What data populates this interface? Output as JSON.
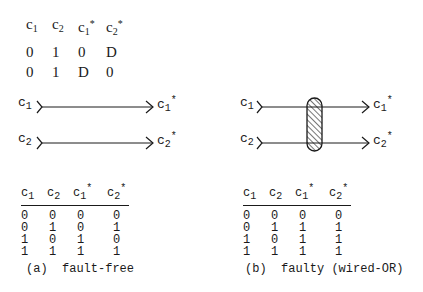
{
  "top_table": {
    "headers": [
      "c1",
      "c2",
      "c1*",
      "c2*"
    ],
    "rows": [
      [
        "0",
        "1",
        "0",
        "D"
      ],
      [
        "0",
        "1",
        "D",
        "0"
      ]
    ]
  },
  "diagram_a": {
    "inputs": [
      "c1",
      "c2"
    ],
    "outputs": [
      "c1*",
      "c2*"
    ]
  },
  "diagram_b": {
    "inputs": [
      "c1",
      "c2"
    ],
    "outputs": [
      "c1*",
      "c2*"
    ],
    "fault_element": "hatched-bridge"
  },
  "table_a": {
    "headers": [
      "c1",
      "c2",
      "c1*",
      "c2*"
    ],
    "rows": [
      [
        "0",
        "0",
        "0",
        "0"
      ],
      [
        "0",
        "1",
        "0",
        "1"
      ],
      [
        "1",
        "0",
        "1",
        "0"
      ],
      [
        "1",
        "1",
        "1",
        "1"
      ]
    ],
    "caption": "(a)  fault-free"
  },
  "table_b": {
    "headers": [
      "c1",
      "c2",
      "c1*",
      "c2*"
    ],
    "rows": [
      [
        "0",
        "0",
        "0",
        "0"
      ],
      [
        "0",
        "1",
        "1",
        "1"
      ],
      [
        "1",
        "0",
        "1",
        "1"
      ],
      [
        "1",
        "1",
        "1",
        "1"
      ]
    ],
    "caption": "(b)  faulty (wired-OR)"
  }
}
